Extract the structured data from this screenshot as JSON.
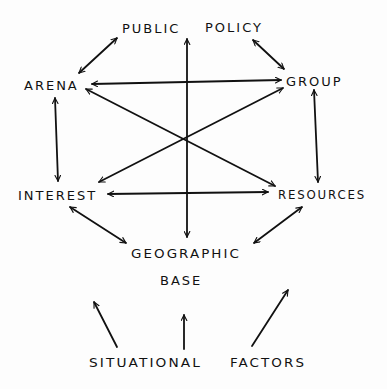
{
  "diagram": {
    "type": "hand-drawn concept diagram",
    "nodes": [
      {
        "id": "public",
        "label": "PUBLIC"
      },
      {
        "id": "policy",
        "label": "POLICY"
      },
      {
        "id": "arena",
        "label": "ARENA"
      },
      {
        "id": "group",
        "label": "GROUP"
      },
      {
        "id": "interest",
        "label": "INTEREST"
      },
      {
        "id": "resources",
        "label": "RESOURCES"
      },
      {
        "id": "geographic",
        "label": "GEOGRAPHIC"
      },
      {
        "id": "base",
        "label": "BASE"
      },
      {
        "id": "situational",
        "label": "SITUATIONAL"
      },
      {
        "id": "factors",
        "label": "FACTORS"
      }
    ],
    "concepts": {
      "public_policy": "PUBLIC POLICY",
      "arena": "ARENA",
      "group": "GROUP",
      "interest": "INTEREST",
      "resources": "RESOURCES",
      "geographic_base": "GEOGRAPHIC BASE",
      "situational_factors": "SITUATIONAL FACTORS"
    },
    "edges": [
      {
        "from": "public_policy",
        "to": "arena",
        "type": "bidirectional"
      },
      {
        "from": "public_policy",
        "to": "group",
        "type": "bidirectional"
      },
      {
        "from": "public_policy",
        "to": "geographic_base",
        "type": "bidirectional"
      },
      {
        "from": "arena",
        "to": "group",
        "type": "bidirectional"
      },
      {
        "from": "arena",
        "to": "resources",
        "type": "bidirectional"
      },
      {
        "from": "group",
        "to": "interest",
        "type": "bidirectional"
      },
      {
        "from": "interest",
        "to": "resources",
        "type": "bidirectional"
      },
      {
        "from": "arena",
        "to": "interest",
        "type": "bidirectional"
      },
      {
        "from": "group",
        "to": "resources",
        "type": "bidirectional"
      },
      {
        "from": "interest",
        "to": "geographic_base",
        "type": "bidirectional"
      },
      {
        "from": "resources",
        "to": "geographic_base",
        "type": "bidirectional"
      },
      {
        "from": "situational_factors",
        "to": "diagram",
        "type": "directed",
        "count": 3
      }
    ]
  }
}
